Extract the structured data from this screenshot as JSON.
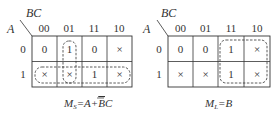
{
  "maps": [
    {
      "id": "ms",
      "row_var": "A",
      "col_var": "BC",
      "col_labels": [
        "00",
        "01",
        "11",
        "10"
      ],
      "row_labels": [
        "0",
        "1"
      ],
      "cells": [
        [
          "0",
          "1",
          "0",
          "×"
        ],
        [
          "×",
          "×",
          "1",
          "×"
        ]
      ],
      "caption_main": "M",
      "caption_sub": "S",
      "caption_expr": "=A+BC",
      "groups": [
        "column 01 (rows 0-1)",
        "row 1 (all columns)"
      ]
    },
    {
      "id": "ml",
      "row_var": "A",
      "col_var": "BC",
      "col_labels": [
        "00",
        "01",
        "11",
        "10"
      ],
      "row_labels": [
        "0",
        "1"
      ],
      "cells": [
        [
          "0",
          "0",
          "1",
          "×"
        ],
        [
          "×",
          "×",
          "1",
          "×"
        ]
      ],
      "caption_main": "M",
      "caption_sub": "L",
      "caption_expr": "=B",
      "groups": [
        "columns 11,10 (rows 0-1)"
      ]
    }
  ]
}
